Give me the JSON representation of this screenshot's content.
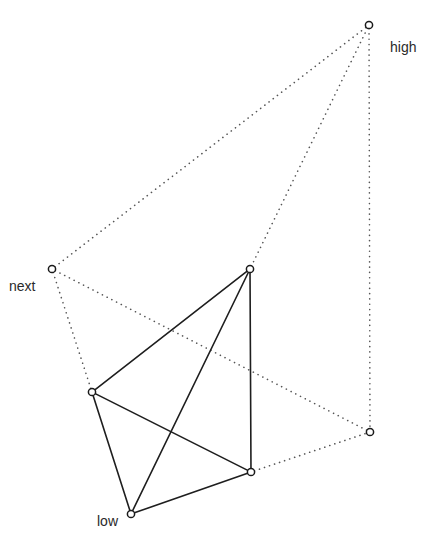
{
  "diagram": {
    "type": "graph",
    "colors": {
      "solid_edge": "#1e1e1e",
      "dotted_edge": "#555555",
      "node_stroke": "#1a1a1a",
      "label": "#2a2a2a",
      "background": "#ffffff"
    },
    "nodes": [
      {
        "id": "high",
        "x": 369,
        "y": 25,
        "label": "high",
        "label_x": 390,
        "label_y": 52
      },
      {
        "id": "next",
        "x": 52,
        "y": 269,
        "label": "next",
        "label_x": 9,
        "label_y": 291
      },
      {
        "id": "top_mid",
        "x": 250,
        "y": 269,
        "label": ""
      },
      {
        "id": "left",
        "x": 92,
        "y": 392,
        "label": ""
      },
      {
        "id": "right",
        "x": 370,
        "y": 432,
        "label": ""
      },
      {
        "id": "bottom_right",
        "x": 251,
        "y": 472,
        "label": ""
      },
      {
        "id": "low",
        "x": 131,
        "y": 514,
        "label": "low",
        "label_x": 97,
        "label_y": 526
      }
    ],
    "solid_edges": [
      {
        "from": "top_mid",
        "to": "left"
      },
      {
        "from": "top_mid",
        "to": "low"
      },
      {
        "from": "top_mid",
        "to": "bottom_right"
      },
      {
        "from": "left",
        "to": "bottom_right"
      },
      {
        "from": "left",
        "to": "low"
      },
      {
        "from": "low",
        "to": "bottom_right"
      }
    ],
    "dotted_edges": [
      {
        "from": "next",
        "to": "high"
      },
      {
        "from": "next",
        "to": "left"
      },
      {
        "from": "next",
        "to": "right"
      },
      {
        "from": "high",
        "to": "top_mid"
      },
      {
        "from": "high",
        "to": "right"
      },
      {
        "from": "bottom_right",
        "to": "right"
      }
    ],
    "labels": {
      "high": "high",
      "next": "next",
      "low": "low"
    }
  }
}
